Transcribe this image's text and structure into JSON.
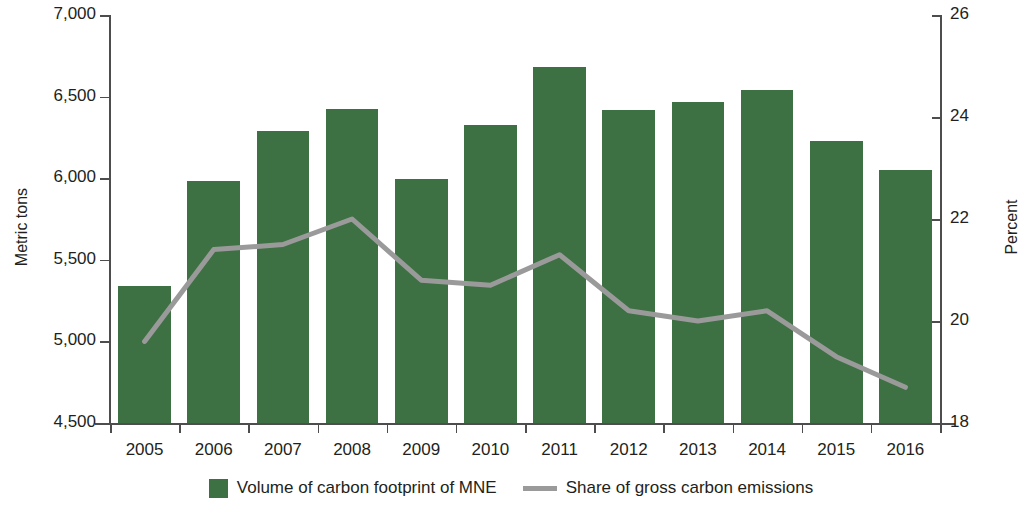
{
  "chart_data": {
    "type": "bar",
    "title": "",
    "categories": [
      "2005",
      "2006",
      "2007",
      "2008",
      "2009",
      "2010",
      "2011",
      "2012",
      "2013",
      "2014",
      "2015",
      "2016"
    ],
    "series": [
      {
        "name": "Volume of carbon footprint of MNE",
        "type": "bar",
        "axis": "left",
        "color": "#3d7042",
        "values": [
          5340,
          5980,
          6290,
          6425,
          5995,
          6325,
          6680,
          6420,
          6470,
          6540,
          6230,
          6050
        ]
      },
      {
        "name": "Share of gross carbon emissions",
        "type": "line",
        "axis": "right",
        "color": "#9a9a9a",
        "values": [
          19.6,
          21.4,
          21.5,
          22.0,
          20.8,
          20.7,
          21.3,
          20.2,
          20.0,
          20.2,
          19.3,
          18.7
        ]
      }
    ],
    "xlabel": "",
    "ylabel": "Metric tons",
    "y2label": "Percent",
    "ylim": [
      4500,
      7000
    ],
    "y2lim": [
      18,
      26
    ],
    "yticks": [
      "4,500",
      "5,000",
      "5,500",
      "6,000",
      "6,500",
      "7,000"
    ],
    "y2ticks": [
      "18",
      "20",
      "22",
      "24",
      "26"
    ],
    "grid": false,
    "legend_position": "bottom"
  },
  "axes": {
    "left_title": "Metric tons",
    "right_title": "Percent"
  },
  "legend": {
    "items": [
      {
        "label": "Volume of carbon footprint of MNE",
        "marker": "square-swatch"
      },
      {
        "label": "Share of gross carbon emissions",
        "marker": "line-swatch"
      }
    ]
  }
}
